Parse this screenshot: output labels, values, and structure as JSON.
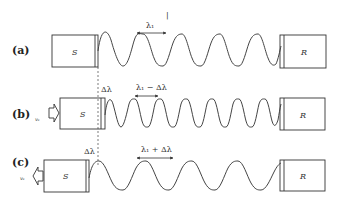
{
  "figure": {
    "topmark": "|",
    "rows": [
      {
        "label": "(a)",
        "source_label": "S",
        "receiver_label": "R",
        "wavelength_label": "λ₁",
        "velocity_label": ""
      },
      {
        "label": "(b)",
        "source_label": "S",
        "receiver_label": "R",
        "shift_label": "Δλ",
        "wavelength_label": "λ₁ − Δλ",
        "velocity_label": "vₛ",
        "motion": "toward receiver"
      },
      {
        "label": "(c)",
        "source_label": "S",
        "receiver_label": "R",
        "shift_label": "Δλ",
        "wavelength_label": "λ₁ + Δλ",
        "velocity_label": "vₛ",
        "motion": "away from receiver"
      }
    ]
  }
}
